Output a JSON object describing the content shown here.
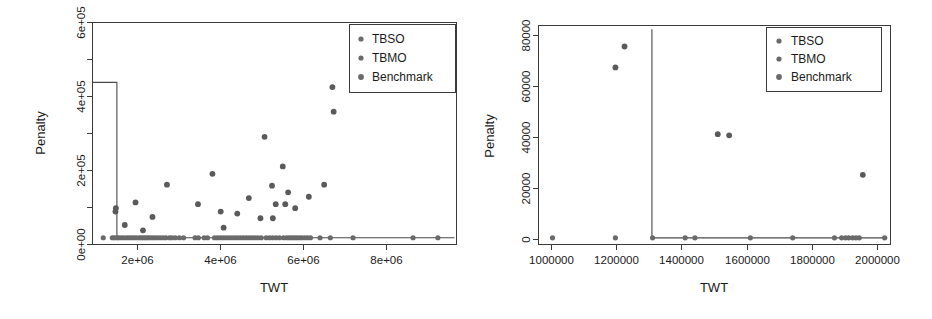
{
  "figure": {
    "background": "#ffffff",
    "marker_color": "#5a5a5a",
    "line_color": "#3a3a3a",
    "panels": 2
  },
  "chart_data": [
    {
      "type": "scatter",
      "panel": "left",
      "title": "",
      "xlabel": "TWT",
      "ylabel": "Penalty",
      "grid": false,
      "legend_position": "top-right",
      "xlim": [
        700000,
        9500000
      ],
      "ylim": [
        -20000,
        640000
      ],
      "xticks": [
        2000000,
        4000000,
        6000000,
        8000000
      ],
      "xtick_labels": [
        "2e+06",
        "4e+06",
        "6e+06",
        "8e+06"
      ],
      "yticks": [
        0,
        200000,
        400000,
        600000
      ],
      "ytick_labels": [
        "0e+00",
        "2e+05",
        "4e+05",
        "6e+05"
      ],
      "ytick_minor": [
        100000,
        300000,
        500000
      ],
      "legend": [
        {
          "name": "TBSO",
          "color": "#6a6a6a"
        },
        {
          "name": "TBMO",
          "color": "#6a6a6a"
        },
        {
          "name": "Benchmark",
          "color": "#5a5a5a"
        }
      ],
      "step_line": {
        "name": "pareto-front",
        "points": [
          [
            700000,
            462000
          ],
          [
            1290000,
            462000
          ],
          [
            1290000,
            0
          ],
          [
            9450000,
            0
          ]
        ]
      },
      "series": [
        {
          "name": "Benchmark",
          "color": "#5a5a5a",
          "points": [
            [
              1255000,
              78000
            ],
            [
              1265000,
              88000
            ],
            [
              1480000,
              38000
            ],
            [
              1740000,
              105000
            ],
            [
              1920000,
              22000
            ],
            [
              2150000,
              62000
            ],
            [
              2500000,
              158000
            ],
            [
              3250000,
              100000
            ],
            [
              3600000,
              190000
            ],
            [
              3800000,
              78000
            ],
            [
              3870000,
              30000
            ],
            [
              4200000,
              72000
            ],
            [
              4480000,
              118000
            ],
            [
              4760000,
              58000
            ],
            [
              4860000,
              300000
            ],
            [
              5040000,
              155000
            ],
            [
              5060000,
              58000
            ],
            [
              5130000,
              100000
            ],
            [
              5300000,
              212000
            ],
            [
              5360000,
              100000
            ],
            [
              5430000,
              135000
            ],
            [
              5600000,
              88000
            ],
            [
              5930000,
              122000
            ],
            [
              6300000,
              158000
            ],
            [
              6500000,
              448000
            ],
            [
              6530000,
              375000
            ],
            [
              6980000,
              600000
            ]
          ]
        },
        {
          "name": "zero-penalty-points",
          "color": "#6a6a6a",
          "y": 0,
          "x": [
            960000,
            1180000,
            1230000,
            1290000,
            1330000,
            1390000,
            1450000,
            1520000,
            1580000,
            1640000,
            1700000,
            1760000,
            1830000,
            1880000,
            1930000,
            1980000,
            2030000,
            2080000,
            2140000,
            2200000,
            2260000,
            2330000,
            2400000,
            2470000,
            2560000,
            2620000,
            2700000,
            2800000,
            2900000,
            3180000,
            3260000,
            3400000,
            3480000,
            3650000,
            3720000,
            3790000,
            3860000,
            3930000,
            4000000,
            4070000,
            4140000,
            4210000,
            4280000,
            4350000,
            4420000,
            4490000,
            4560000,
            4630000,
            4700000,
            4780000,
            4900000,
            4980000,
            5060000,
            5140000,
            5220000,
            5320000,
            5400000,
            5460000,
            5520000,
            5580000,
            5640000,
            5700000,
            5760000,
            5830000,
            5900000,
            5970000,
            6200000,
            6450000,
            7000000,
            8450000,
            9050000
          ]
        }
      ]
    },
    {
      "type": "scatter",
      "panel": "right",
      "title": "",
      "xlabel": "TWT",
      "ylabel": "Penalty",
      "grid": false,
      "legend_position": "top-right",
      "xlim": [
        960000,
        2040000
      ],
      "ylim": [
        -2700,
        86000
      ],
      "xticks": [
        1000000,
        1200000,
        1400000,
        1600000,
        1800000,
        2000000
      ],
      "xtick_labels": [
        "1000000",
        "1200000",
        "1400000",
        "1600000",
        "1800000",
        "2000000"
      ],
      "yticks": [
        0,
        20000,
        40000,
        60000,
        80000
      ],
      "ytick_labels": [
        "0",
        "20000",
        "40000",
        "60000",
        "80000"
      ],
      "legend": [
        {
          "name": "TBSO",
          "color": "#6a6a6a"
        },
        {
          "name": "TBMO",
          "color": "#6a6a6a"
        },
        {
          "name": "Benchmark",
          "color": "#5a5a5a"
        }
      ],
      "step_line": {
        "name": "pareto-front",
        "points": [
          [
            1308000,
            84500
          ],
          [
            1308000,
            0
          ],
          [
            2030000,
            0
          ]
        ]
      },
      "series": [
        {
          "name": "Benchmark",
          "color": "#5a5a5a",
          "points": [
            [
              1196000,
              69000
            ],
            [
              1224000,
              77500
            ],
            [
              1510000,
              42000
            ],
            [
              1545000,
              41500
            ],
            [
              1955000,
              25500
            ]
          ]
        },
        {
          "name": "zero-penalty-points",
          "color": "#6a6a6a",
          "y": 0,
          "x": [
            1003000,
            1196000,
            1310000,
            1410000,
            1440000,
            1610000,
            1740000,
            1868000,
            1890000,
            1902000,
            1912000,
            1924000,
            1934000,
            1944000,
            2022000
          ]
        }
      ]
    }
  ],
  "left_panel": {
    "ylabel": "Penalty",
    "xlabel": "TWT",
    "ytick_labels": [
      "0e+00",
      "2e+05",
      "4e+05",
      "6e+05"
    ],
    "xtick_labels": [
      "2e+06",
      "4e+06",
      "6e+06",
      "8e+06"
    ],
    "legend_items": [
      "TBSO",
      "TBMO",
      "Benchmark"
    ]
  },
  "right_panel": {
    "ylabel": "Penalty",
    "xlabel": "TWT",
    "ytick_labels": [
      "0",
      "20000",
      "40000",
      "60000",
      "80000"
    ],
    "xtick_labels": [
      "1000000",
      "1200000",
      "1400000",
      "1600000",
      "1800000",
      "2000000"
    ],
    "legend_items": [
      "TBSO",
      "TBMO",
      "Benchmark"
    ]
  }
}
